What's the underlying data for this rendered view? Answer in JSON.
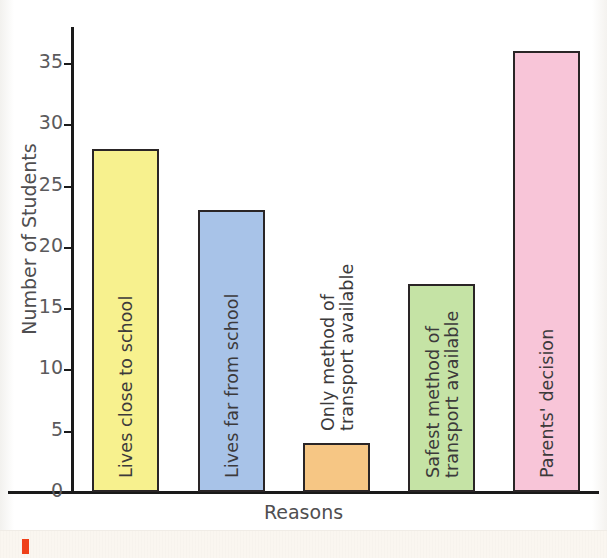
{
  "chart_data": {
    "type": "bar",
    "title": "",
    "xlabel": "Reasons",
    "ylabel": "Number of Students",
    "categories": [
      "Lives close to school",
      "Lives far from school",
      "Only method of transport available",
      "Safest method of transport available",
      "Parents' decision"
    ],
    "values": [
      28,
      23,
      4,
      17,
      36
    ],
    "ylim": [
      0,
      38
    ],
    "yticks": [
      0,
      5,
      10,
      15,
      20,
      25,
      30,
      35
    ],
    "ytick_labels": [
      "0",
      "5",
      "10",
      "15",
      "20",
      "25",
      "30",
      "35"
    ],
    "grid": false,
    "legend": "none",
    "bar_colors": [
      "#F7F18E",
      "#A8C3E8",
      "#F6C684",
      "#C5E3A5",
      "#F8C5D8"
    ],
    "bar_edge_color": "#2A2526",
    "label_placement": [
      "inside",
      "inside",
      "above",
      "inside",
      "inside"
    ],
    "label_lines": [
      [
        "Lives close to school"
      ],
      [
        "Lives far from school"
      ],
      [
        "Only method of",
        "transport available"
      ],
      [
        "Safest method of",
        "transport available"
      ],
      [
        "Parents' decision"
      ]
    ]
  },
  "axes": {
    "y_title": "Number of Students",
    "x_title": "Reasons",
    "ticks": [
      {
        "label": "35",
        "value": 35
      },
      {
        "label": "30",
        "value": 30
      },
      {
        "label": "25",
        "value": 25
      },
      {
        "label": "20",
        "value": 20
      },
      {
        "label": "15",
        "value": 15
      },
      {
        "label": "10",
        "value": 10
      },
      {
        "label": "5",
        "value": 5
      },
      {
        "label": "0",
        "value": 0
      }
    ]
  },
  "page": {
    "title_partial": "",
    "bottom_mark_color": "#EF4019"
  }
}
